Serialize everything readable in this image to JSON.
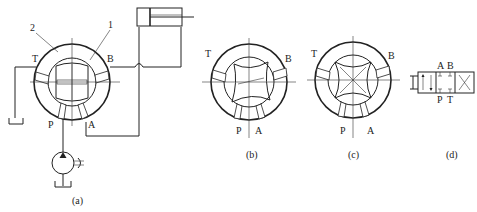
{
  "figure": {
    "subfigures": [
      {
        "id": "a",
        "caption": "(a)",
        "callouts": [
          {
            "label": "2",
            "target": "valve-body"
          },
          {
            "label": "1",
            "target": "valve-core"
          }
        ],
        "ports": [
          "T",
          "B",
          "P",
          "A"
        ],
        "components": [
          "rotary-valve",
          "hydraulic-cylinder",
          "pump",
          "tank-left",
          "tank-pump"
        ]
      },
      {
        "id": "b",
        "caption": "(b)",
        "ports": [
          "T",
          "B",
          "P",
          "A"
        ]
      },
      {
        "id": "c",
        "caption": "(c)",
        "ports": [
          "T",
          "B",
          "P",
          "A"
        ]
      },
      {
        "id": "d",
        "caption": "(d)",
        "ports_top": [
          "A",
          "B"
        ],
        "ports_bottom": [
          "P",
          "T"
        ],
        "symbol": "4-way 3-position directional valve, manual"
      }
    ]
  },
  "labels": {
    "a": {
      "callout2": "2",
      "callout1": "1",
      "T": "T",
      "B": "B",
      "P": "P",
      "A": "A",
      "caption": "(a)"
    },
    "b": {
      "T": "T",
      "B": "B",
      "P": "P",
      "A": "A",
      "caption": "(b)"
    },
    "c": {
      "T": "T",
      "B": "B",
      "P": "P",
      "A": "A",
      "caption": "(c)"
    },
    "d": {
      "A": "A",
      "B": "B",
      "P": "P",
      "T": "T",
      "caption": "(d)"
    }
  }
}
